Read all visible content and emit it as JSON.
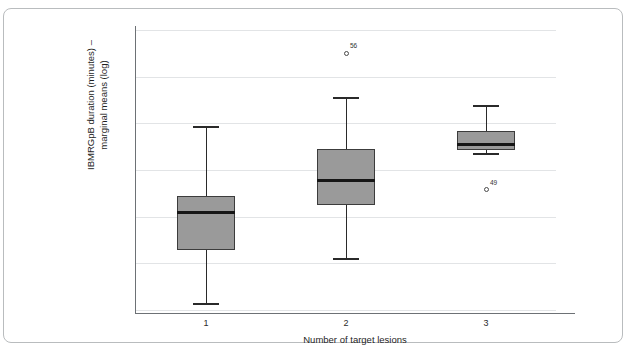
{
  "chart_data": {
    "type": "box",
    "title": "",
    "xlabel": "Number of target lesions",
    "ylabel": "IBMRGpB duration (minutes) – marginal means (log)",
    "ylabel_line1": "IBMRGpB duration (minutes) –",
    "ylabel_line2": "marginal means (log)",
    "categories": [
      "1",
      "2",
      "3"
    ],
    "ylim": [
      2.0,
      5.0
    ],
    "ytick_values": [
      2.0,
      2.5,
      3.0,
      3.5,
      4.0,
      4.5,
      5.0
    ],
    "ytick_labels": [
      "2.00",
      "2.50",
      "3.00",
      "3.50",
      "4.00",
      "4.50",
      "5.00"
    ],
    "grid": true,
    "legend": "none",
    "boxes": [
      {
        "category": "1",
        "whisker_low": 2.08,
        "q1": 2.64,
        "median": 3.05,
        "q3": 3.22,
        "whisker_high": 3.97,
        "outliers": []
      },
      {
        "category": "2",
        "whisker_low": 2.56,
        "q1": 3.13,
        "median": 3.39,
        "q3": 3.72,
        "whisker_high": 4.28,
        "outliers": [
          {
            "value": 4.75,
            "label": "56"
          }
        ]
      },
      {
        "category": "3",
        "whisker_low": 3.68,
        "q1": 3.71,
        "median": 3.77,
        "q3": 3.92,
        "whisker_high": 4.2,
        "outliers": [
          {
            "value": 3.29,
            "label": "49"
          }
        ]
      }
    ],
    "colors": {
      "box_fill": "#9a9a9a",
      "box_edge": "#3c3c3c",
      "median": "#161616",
      "whisker": "#2a2a2a",
      "grid": "#e2e4e6",
      "axis": "#6d7175",
      "frame": "#b9bcbe",
      "background": "#ffffff"
    }
  }
}
